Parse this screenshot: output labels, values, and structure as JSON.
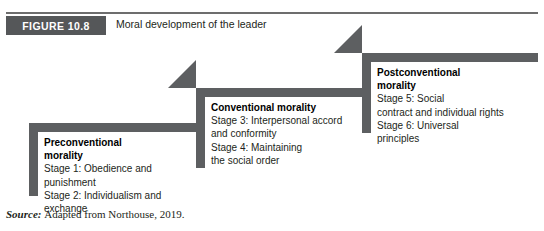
{
  "figure": {
    "tag": "FIGURE 10.8",
    "caption": "Moral development of the leader",
    "accent_dark": "#5d5f61",
    "tag_background": "#555759",
    "rule_color": "#6d6d6d",
    "text_color": "#231f20"
  },
  "blocks": [
    {
      "id": "preconventional",
      "title_line_1": "Preconventional",
      "title_line_2": "morality",
      "lines": [
        "Stage 1: Obedience and",
        "punishment",
        "Stage 2: Individualism and",
        "exchange"
      ]
    },
    {
      "id": "conventional",
      "title_line_1": "Conventional morality",
      "title_line_2": "",
      "lines": [
        "Stage 3: Interpersonal accord",
        "and conformity",
        "Stage 4: Maintaining",
        "the social order"
      ]
    },
    {
      "id": "postconventional",
      "title_line_1": "Postconventional",
      "title_line_2": "morality",
      "lines": [
        "Stage 5: Social",
        "contract and individual rights",
        "Stage 6: Universal",
        "principles"
      ]
    }
  ],
  "source": {
    "label": "Source:",
    "text": "Adapted from Northouse, 2019."
  }
}
